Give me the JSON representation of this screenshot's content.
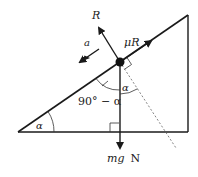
{
  "diagram": {
    "type": "inclined-plane-force-diagram",
    "labels": {
      "normal_reaction": "R",
      "friction": "μR",
      "acceleration": "a",
      "weight_italic": "mg",
      "weight_unit": "N",
      "incline_angle": "α",
      "angle_between_weight_and_incline": "90° − α",
      "angle_between_weight_and_normal": "α"
    },
    "colors": {
      "line": "#1a1a1a",
      "dashed": "#666666",
      "background": "#ffffff"
    },
    "geometry": {
      "triangle": {
        "bottom_left": [
          18,
          132
        ],
        "bottom_right": [
          188,
          132
        ],
        "top_right": [
          188,
          15
        ]
      },
      "particle": [
        120,
        62
      ]
    }
  }
}
